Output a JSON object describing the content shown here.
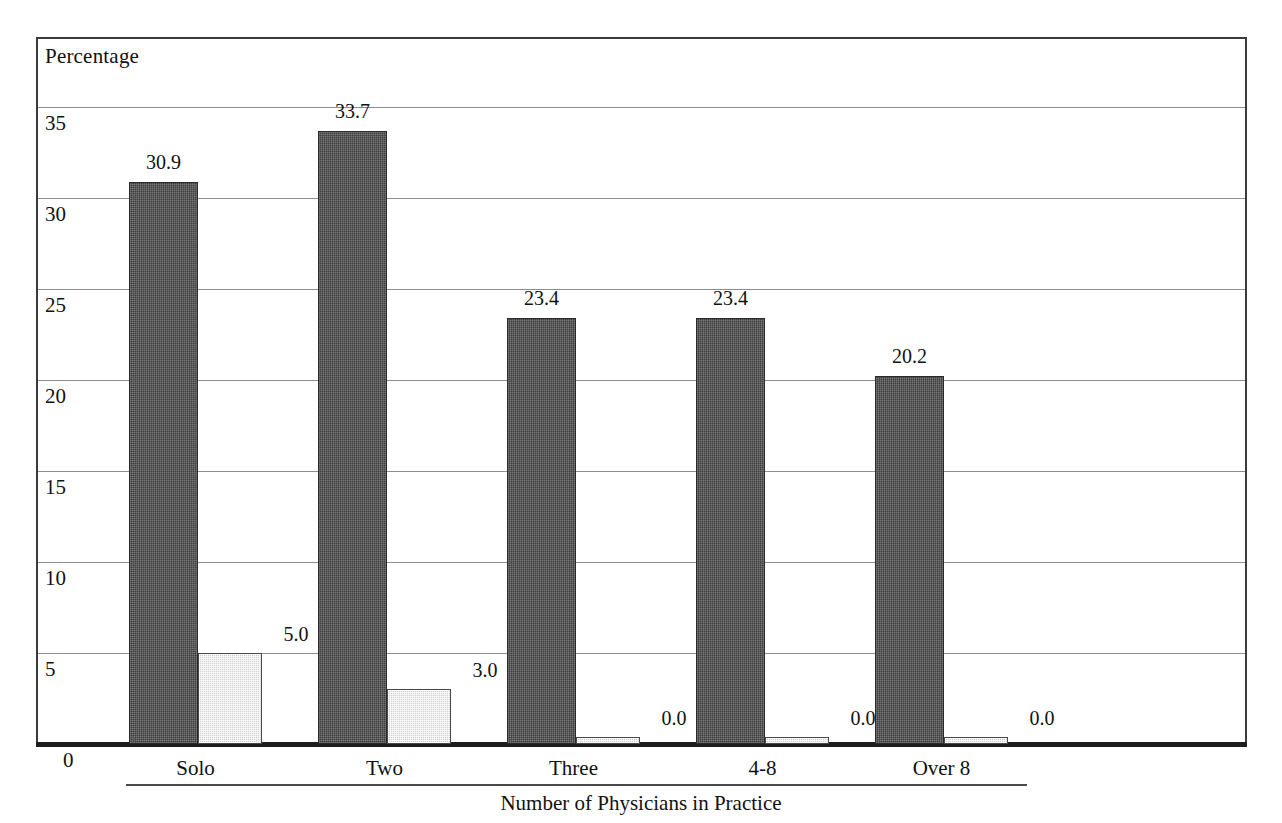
{
  "chart_data": {
    "type": "bar",
    "title": "",
    "ylabel": "Percentage",
    "xlabel": "Number of Physicians in Practice",
    "categories": [
      "Solo",
      "Two",
      "Three",
      "4-8",
      "Over 8"
    ],
    "series": [
      {
        "name": "primary",
        "values": [
          30.9,
          33.7,
          23.4,
          23.4,
          20.2
        ],
        "labels": [
          "30.9",
          "33.7",
          "23.4",
          "23.4",
          "20.2"
        ],
        "color": "#3d3d3d"
      },
      {
        "name": "secondary",
        "values": [
          5.0,
          3.0,
          0.0,
          0.0,
          0.0
        ],
        "labels": [
          "5.0",
          "3.0",
          "0.0",
          "0.0",
          "0.0"
        ],
        "color": "#cfcfcf"
      }
    ],
    "ylim": [
      0,
      36
    ],
    "yticks": [
      35,
      30,
      25,
      20,
      15,
      10,
      5,
      0
    ],
    "ytick_labels": [
      "35",
      "30",
      "25",
      "20",
      "15",
      "10",
      "5",
      "0"
    ],
    "grid": true,
    "legend": "none"
  },
  "axes": {
    "y_title": "Percentage",
    "x_title": "Number of Physicians in Practice"
  }
}
